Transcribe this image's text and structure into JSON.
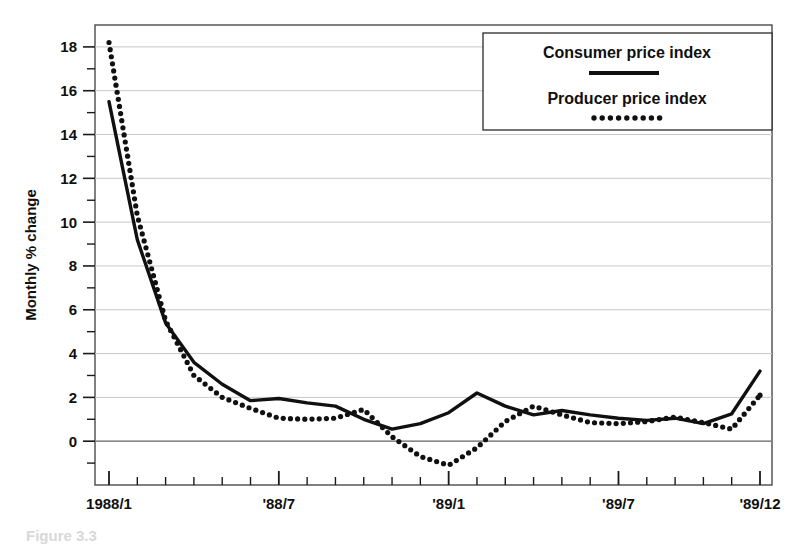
{
  "figure": {
    "caption_partial": "Figure 3.3",
    "background_color": "#ffffff",
    "frame_color": "#4a4a4a",
    "grid_color": "#c8c8c8",
    "series_color": "#101010"
  },
  "legend": {
    "position": "top-right",
    "entries": [
      {
        "label": "Consumer price index",
        "marker": "solid-line"
      },
      {
        "label": "Producer price index",
        "marker": "dotted-line"
      }
    ]
  },
  "chart_data": {
    "type": "line",
    "title": "",
    "subtitle": "",
    "xlabel": "",
    "ylabel": "Monthly % change",
    "grid": true,
    "legend_position": "top-right",
    "ylim": [
      -2,
      19
    ],
    "yticks": [
      0,
      2,
      4,
      6,
      8,
      10,
      12,
      14,
      16,
      18
    ],
    "ytick_labels": [
      "0",
      "2",
      "4",
      "6",
      "8",
      "10",
      "12",
      "14",
      "16",
      "18"
    ],
    "yminor_ticks": [
      -1,
      1,
      3,
      5,
      7,
      9,
      11,
      13,
      15,
      17
    ],
    "x": [
      "1988/1",
      "1988/2",
      "1988/3",
      "1988/4",
      "1988/5",
      "1988/6",
      "1988/7",
      "1988/8",
      "1988/9",
      "1988/10",
      "1988/11",
      "1988/12",
      "1989/1",
      "1989/2",
      "1989/3",
      "1989/4",
      "1989/5",
      "1989/6",
      "1989/7",
      "1989/8",
      "1989/9",
      "1989/10",
      "1989/11",
      "1989/12"
    ],
    "xtick_labels": [
      "1988/1",
      "'88/7",
      "'89/1",
      "'89/7",
      "'89/12"
    ],
    "xtick_label_positions": [
      0,
      6,
      12,
      18,
      23
    ],
    "series": [
      {
        "name": "Consumer price index",
        "style": "solid",
        "values": [
          15.5,
          9.2,
          5.4,
          3.6,
          2.6,
          1.85,
          1.95,
          1.75,
          1.6,
          1.0,
          0.55,
          0.8,
          1.3,
          2.2,
          1.6,
          1.2,
          1.4,
          1.2,
          1.05,
          0.95,
          1.05,
          0.8,
          1.25,
          3.2
        ]
      },
      {
        "name": "Producer price index",
        "style": "dotted",
        "values": [
          18.2,
          10.3,
          5.5,
          3.0,
          2.0,
          1.5,
          1.05,
          1.0,
          1.05,
          1.45,
          0.2,
          -0.7,
          -1.1,
          -0.3,
          0.9,
          1.6,
          1.2,
          0.85,
          0.8,
          0.9,
          1.1,
          0.85,
          0.55,
          2.1
        ]
      }
    ]
  }
}
